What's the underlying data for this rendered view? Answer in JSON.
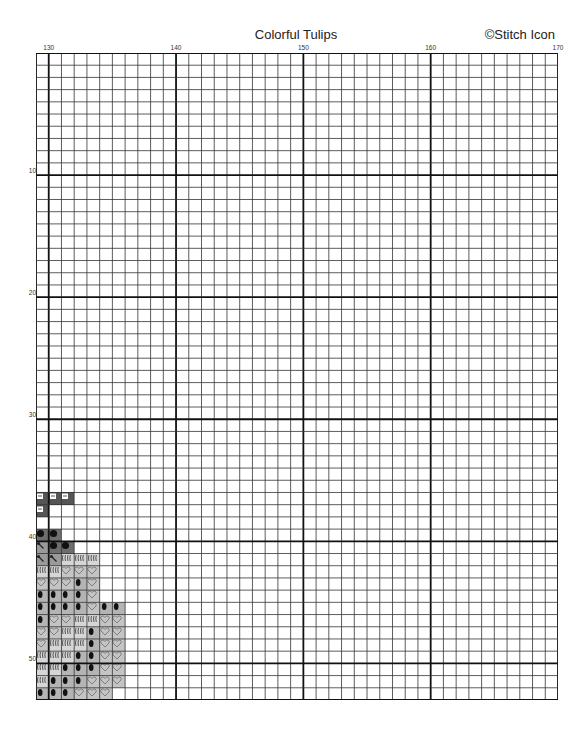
{
  "header": {
    "title": "Colorful Tulips",
    "copyright": "©Stitch Icon"
  },
  "grid": {
    "columns": 41,
    "rows": 53,
    "col_start": 129,
    "row_start": 0,
    "col_labels": [
      {
        "value": "130",
        "col": 1
      },
      {
        "value": "140",
        "col": 11
      },
      {
        "value": "150",
        "col": 21
      },
      {
        "value": "160",
        "col": 31
      },
      {
        "value": "170",
        "col": 41
      }
    ],
    "row_labels": [
      {
        "value": "10",
        "row": 10
      },
      {
        "value": "20",
        "row": 20
      },
      {
        "value": "30",
        "row": 30
      },
      {
        "value": "40",
        "row": 40
      },
      {
        "value": "50",
        "row": 50
      }
    ],
    "major_every": 10,
    "line_color": "#333333",
    "major_line_color": "#111111"
  },
  "legend_symbols": {
    "cup": {
      "bg": "#555555",
      "fg": "#ffffff",
      "icon": "cup-icon"
    },
    "dot": {
      "bg": "#6e6e6e",
      "fg": "#111111",
      "icon": "dot-icon"
    },
    "needle": {
      "bg": "#9a9a9a",
      "fg": "#222222",
      "icon": "needle-icon"
    },
    "wavy": {
      "bg": "#d6d6d6",
      "fg": "#555555",
      "icon": "wavy-icon"
    },
    "heart": {
      "bg": "#c4c4c4",
      "fg": "#777777",
      "icon": "heart-icon"
    },
    "bean": {
      "bg": "#b4b4b4",
      "fg": "#111111",
      "icon": "bean-icon"
    }
  },
  "stitches": [
    {
      "row": 36,
      "cells": [
        "cup",
        "cup",
        "cup"
      ]
    },
    {
      "row": 37,
      "cells": [
        "cup"
      ]
    },
    {
      "row": 39,
      "cells": [
        "dot",
        "dot"
      ]
    },
    {
      "row": 40,
      "cells": [
        "needle",
        "dot",
        "dot"
      ]
    },
    {
      "row": 41,
      "cells": [
        "needle",
        "needle",
        "wavy",
        "wavy",
        "wavy"
      ]
    },
    {
      "row": 42,
      "cells": [
        "wavy",
        "wavy",
        "heart",
        "heart",
        "heart"
      ]
    },
    {
      "row": 43,
      "cells": [
        "heart",
        "heart",
        "heart",
        "bean",
        "heart"
      ]
    },
    {
      "row": 44,
      "cells": [
        "bean",
        "bean",
        "bean",
        "bean",
        "heart"
      ]
    },
    {
      "row": 45,
      "cells": [
        "bean",
        "bean",
        "bean",
        "bean",
        "heart",
        "bean",
        "bean"
      ]
    },
    {
      "row": 46,
      "cells": [
        "bean",
        "heart",
        "heart",
        "wavy",
        "wavy",
        "heart",
        "heart"
      ]
    },
    {
      "row": 47,
      "cells": [
        "heart",
        "heart",
        "wavy",
        "wavy",
        "bean",
        "heart",
        "heart"
      ]
    },
    {
      "row": 48,
      "cells": [
        "heart",
        "wavy",
        "wavy",
        "wavy",
        "bean",
        "heart",
        "heart"
      ]
    },
    {
      "row": 49,
      "cells": [
        "wavy",
        "wavy",
        "wavy",
        "bean",
        "bean",
        "heart",
        "heart"
      ]
    },
    {
      "row": 50,
      "cells": [
        "wavy",
        "wavy",
        "bean",
        "bean",
        "bean",
        "heart",
        "heart"
      ]
    },
    {
      "row": 51,
      "cells": [
        "wavy",
        "bean",
        "bean",
        "bean",
        "heart",
        "heart",
        "heart"
      ]
    },
    {
      "row": 52,
      "cells": [
        "bean",
        "bean",
        "bean",
        "heart",
        "heart",
        "heart"
      ]
    }
  ]
}
